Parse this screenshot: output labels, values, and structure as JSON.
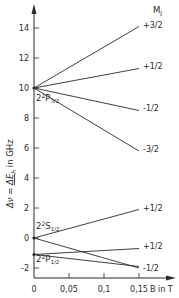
{
  "chart_data": {
    "type": "line",
    "xlabel": "B in T",
    "ylabel": "Δν = ΔE/h in GHz",
    "xlim": [
      0,
      0.15
    ],
    "ylim": [
      -2.6,
      15.2
    ],
    "grid": false,
    "x_ticks": [
      "0",
      "0,05",
      "0,1",
      "0,15"
    ],
    "x_tick_values": [
      0,
      0.05,
      0.1,
      0.15
    ],
    "y_ticks": [
      "-2",
      "0",
      "2",
      "4",
      "6",
      "8",
      "10",
      "12",
      "14"
    ],
    "y_tick_values": [
      -2,
      0,
      2,
      4,
      6,
      8,
      10,
      12,
      14
    ],
    "legend_header": "M_J",
    "levels": [
      {
        "name": "2²P3/2",
        "label_main": "2",
        "label_sup": "2",
        "label_sym": "P",
        "label_sub": "3/2",
        "zero_field": 10.0
      },
      {
        "name": "2²S1/2",
        "label_main": "2",
        "label_sup": "2",
        "label_sym": "S",
        "label_sub": "1/2",
        "zero_field": 0.0
      },
      {
        "name": "2²P1/2",
        "label_main": "2",
        "label_sup": "2",
        "label_sym": "P",
        "label_sub": "1/2",
        "zero_field": -1.1
      }
    ],
    "series": [
      {
        "name": "P3/2 +3/2",
        "level": "2²P3/2",
        "mj": "+3/2",
        "x": [
          0,
          0.15
        ],
        "values": [
          10.0,
          14.1
        ]
      },
      {
        "name": "P3/2 +1/2",
        "level": "2²P3/2",
        "mj": "+1/2",
        "x": [
          0,
          0.15
        ],
        "values": [
          10.0,
          11.3
        ]
      },
      {
        "name": "P3/2 -1/2",
        "level": "2²P3/2",
        "mj": "-1/2",
        "x": [
          0,
          0.15
        ],
        "values": [
          10.0,
          8.5
        ]
      },
      {
        "name": "P3/2 -3/2",
        "level": "2²P3/2",
        "mj": "-3/2",
        "x": [
          0,
          0.15
        ],
        "values": [
          10.0,
          5.8
        ]
      },
      {
        "name": "S1/2 +1/2",
        "level": "2²S1/2",
        "mj": "+1/2",
        "x": [
          0,
          0.15
        ],
        "values": [
          0.0,
          1.9
        ]
      },
      {
        "name": "S1/2 -1/2",
        "level": "2²S1/2",
        "mj": "-1/2",
        "x": [
          0,
          0.15
        ],
        "values": [
          0.0,
          -2.0
        ]
      },
      {
        "name": "P1/2 +1/2",
        "level": "2²P1/2",
        "mj": "+1/2",
        "x": [
          0,
          0.15
        ],
        "values": [
          -1.1,
          -0.7
        ]
      },
      {
        "name": "P1/2 -1/2",
        "level": "2²P1/2",
        "mj": "-1/2",
        "x": [
          0,
          0.15
        ],
        "values": [
          -1.1,
          -1.9
        ]
      }
    ],
    "end_labels": [
      "+3/2",
      "+1/2",
      "-1/2",
      "-3/2",
      "+1/2",
      "+1/2",
      "-1/2"
    ],
    "colors": {
      "line": "#2a2a2a",
      "background": "#ffffff"
    }
  }
}
